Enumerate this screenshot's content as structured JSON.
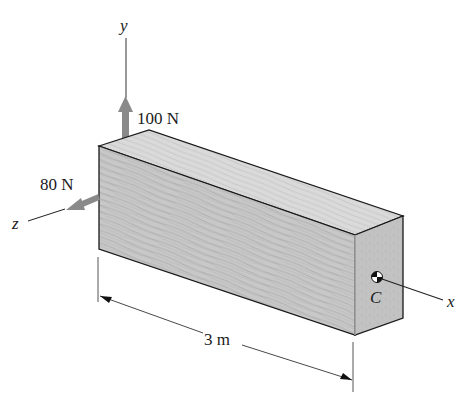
{
  "diagram": {
    "axes": {
      "x": "x",
      "y": "y",
      "z": "z"
    },
    "forces": [
      {
        "label": "100 N",
        "direction": "y"
      },
      {
        "label": "80 N",
        "direction": "z"
      }
    ],
    "centroid_label": "C",
    "dimension": {
      "label": "3 m"
    },
    "colors": {
      "force_arrow": "#8a8a8a",
      "wood_front": "#c9c9c9",
      "wood_top": "#dcdcdc",
      "wood_end": "#bdbdbd",
      "outline": "#1a1a1a"
    }
  }
}
